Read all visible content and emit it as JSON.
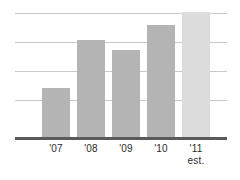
{
  "chart_data": {
    "type": "bar",
    "title": "",
    "subtitle": "",
    "xlabel": "",
    "ylabel": "",
    "categories": [
      "'07",
      "'08",
      "'09",
      "'10",
      "'11"
    ],
    "category_sublabels": [
      "",
      "",
      "",
      "",
      "est."
    ],
    "values": [
      49,
      97,
      87,
      112,
      125
    ],
    "ylim": [
      0,
      125
    ],
    "grid": true,
    "gridline_count": 4,
    "legend": "none",
    "series": [
      {
        "name": "",
        "values": [
          49,
          97,
          87,
          112,
          125
        ]
      }
    ],
    "bar_colors": [
      "#b4b4b4",
      "#b4b4b4",
      "#b4b4b4",
      "#b4b4b4",
      "#dcdcdc"
    ],
    "axis_color": "#5a5a5a",
    "gridline_color": "#c9c9c9",
    "background_color": "#ffffff",
    "annotations": [
      "est."
    ]
  },
  "bars": [
    {
      "label": "'07",
      "sublabel": "",
      "value": 49,
      "x": 42,
      "height": 49,
      "estimate": false
    },
    {
      "label": "'08",
      "sublabel": "",
      "value": 97,
      "x": 77,
      "height": 97,
      "estimate": false
    },
    {
      "label": "'09",
      "sublabel": "",
      "value": 87,
      "x": 112,
      "height": 87,
      "estimate": false
    },
    {
      "label": "'10",
      "sublabel": "",
      "value": 112,
      "x": 147,
      "height": 112,
      "estimate": false
    },
    {
      "label": "'11",
      "sublabel": "est.",
      "value": 125,
      "x": 182,
      "height": 125,
      "estimate": true
    }
  ],
  "gridlines": [
    {
      "y": 13
    },
    {
      "y": 42
    },
    {
      "y": 71
    },
    {
      "y": 100
    }
  ]
}
